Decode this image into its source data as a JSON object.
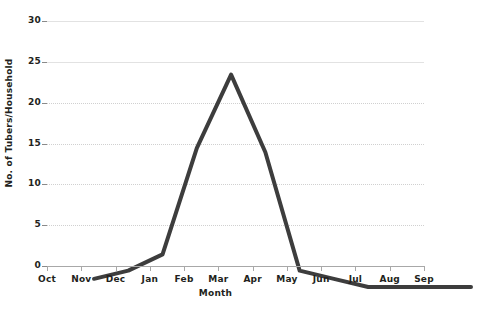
{
  "chart_data": {
    "type": "line",
    "title": "",
    "xlabel": "Month",
    "ylabel": "No. of Tubers/Household",
    "categories": [
      "Oct",
      "Nov",
      "Dec",
      "Jan",
      "Feb",
      "Mar",
      "Apr",
      "May",
      "Jun",
      "Jul",
      "Aug",
      "Sep"
    ],
    "values": [
      1,
      2,
      4,
      17,
      26,
      16.5,
      2,
      1,
      0,
      0,
      0,
      0
    ],
    "series": [
      {
        "name": "No. of Tubers/Household",
        "values": [
          1,
          2,
          4,
          17,
          26,
          16.5,
          2,
          1,
          0,
          0,
          0,
          0
        ]
      }
    ],
    "ylim": [
      0,
      30
    ],
    "ytick_labels": [
      "0",
      "5",
      "10",
      "15",
      "20",
      "25",
      "30"
    ],
    "ytick_values": [
      0,
      5,
      10,
      15,
      20,
      25,
      30
    ],
    "grid": true,
    "grid_axis": "y",
    "legend": false,
    "legend_position": "none",
    "line_color": "#3d3d3d",
    "line_width": 4,
    "background_color": "#ffffff",
    "axis_color": "#a8a8a8",
    "grid_color": "#d0d0d0",
    "text_color": "#231f20"
  }
}
